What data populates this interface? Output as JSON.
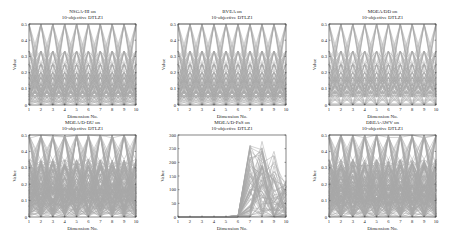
{
  "chart_data": [
    {
      "type": "line",
      "subtype": "parallel-coordinates",
      "title": "NSGA-III on 10-objective DTLZ1",
      "title_lines": [
        "NSGA-III on",
        "10-objective DTLZ1"
      ],
      "xlabel": "Dimension No.",
      "ylabel": "Value",
      "x": [
        1,
        2,
        3,
        4,
        5,
        6,
        7,
        8,
        9,
        10
      ],
      "xticks": [
        "1",
        "2",
        "3",
        "4",
        "5",
        "6",
        "7",
        "8",
        "9",
        "10"
      ],
      "yticks": [
        "0",
        "0.1",
        "0.2",
        "0.3",
        "0.4",
        "0.5"
      ],
      "ylim": [
        0,
        0.5
      ],
      "pattern": "regular",
      "levels": [
        0.5,
        0.333,
        0.25,
        0.2,
        0.167,
        0.125,
        0.1,
        0.0833,
        0.0625,
        0.05,
        0.03,
        0.0
      ],
      "flat_levels": [
        0.167,
        0.18,
        0.03,
        0.02
      ]
    },
    {
      "type": "line",
      "subtype": "parallel-coordinates",
      "title": "BVEA on 10-objective DTLZ1",
      "title_lines": [
        "BVEA on",
        "10-objective DTLZ1"
      ],
      "xlabel": "Dimension No.",
      "ylabel": "Value",
      "x": [
        1,
        2,
        3,
        4,
        5,
        6,
        7,
        8,
        9,
        10
      ],
      "xticks": [
        "1",
        "2",
        "3",
        "4",
        "5",
        "6",
        "7",
        "8",
        "9",
        "10"
      ],
      "yticks": [
        "0",
        "0.1",
        "0.2",
        "0.3",
        "0.4",
        "0.5"
      ],
      "ylim": [
        0,
        0.5
      ],
      "pattern": "regular",
      "levels": [
        0.5,
        0.333,
        0.25,
        0.2,
        0.167,
        0.125,
        0.1,
        0.0833,
        0.0625,
        0.05,
        0.03,
        0.0
      ],
      "flat_levels": [
        0.14,
        0.05,
        0.03
      ]
    },
    {
      "type": "line",
      "subtype": "parallel-coordinates",
      "title": "MOEA/DD on 10-objective DTLZ1",
      "title_lines": [
        "MOEA/DD on",
        "10-objective DTLZ1"
      ],
      "xlabel": "Dimension No.",
      "ylabel": "Value",
      "x": [
        1,
        2,
        3,
        4,
        5,
        6,
        7,
        8,
        9,
        10
      ],
      "xticks": [
        "1",
        "2",
        "3",
        "4",
        "5",
        "6",
        "7",
        "8",
        "9",
        "10"
      ],
      "yticks": [
        "0",
        "0.1",
        "0.2",
        "0.3",
        "0.4",
        "0.5"
      ],
      "ylim": [
        0,
        0.5
      ],
      "pattern": "regular",
      "levels": [
        0.5,
        0.333,
        0.25,
        0.2,
        0.167,
        0.125,
        0.1,
        0.0833,
        0.0625,
        0.05,
        0.0
      ],
      "flat_levels": [
        0.167,
        0.15,
        0.03,
        0.01
      ]
    },
    {
      "type": "line",
      "subtype": "parallel-coordinates",
      "title": "MOEA/D-DU on 10-objective DTLZ1",
      "title_lines": [
        "MOEA/D-DU on",
        "10-objective DTLZ1"
      ],
      "xlabel": "Dimension No.",
      "ylabel": "Value",
      "x": [
        1,
        2,
        3,
        4,
        5,
        6,
        7,
        8,
        9,
        10
      ],
      "xticks": [
        "1",
        "2",
        "3",
        "4",
        "5",
        "6",
        "7",
        "8",
        "9",
        "10"
      ],
      "yticks": [
        "0",
        "0.1",
        "0.2",
        "0.3",
        "0.4",
        "0.5"
      ],
      "ylim": [
        0,
        0.5
      ],
      "pattern": "regular-noisy",
      "levels": [
        0.5,
        0.333,
        0.3,
        0.25,
        0.2,
        0.167,
        0.15,
        0.125,
        0.1,
        0.0833,
        0.05,
        0.03,
        0.0
      ],
      "flat_levels": [
        0.167,
        0.03,
        0.02
      ]
    },
    {
      "type": "line",
      "subtype": "parallel-coordinates",
      "title": "MOEA/D-PaS on 10-objective DTLZ1",
      "title_lines": [
        "MOEA/D-PaS on",
        "10-objective DTLZ1"
      ],
      "xlabel": "Dimension No.",
      "ylabel": "Value",
      "x": [
        1,
        2,
        3,
        4,
        5,
        6,
        7,
        8,
        9,
        10
      ],
      "xticks": [
        "1",
        "2",
        "3",
        "4",
        "5",
        "6",
        "7",
        "8",
        "9",
        "10"
      ],
      "yticks": [
        "0",
        "50",
        "100",
        "150",
        "200",
        "250",
        "300"
      ],
      "ylim": [
        0,
        300
      ],
      "pattern": "degenerate",
      "peak_values": {
        "6": 5,
        "7": 265,
        "8": 280,
        "9": 240,
        "10": 135
      },
      "note": "Dimensions 1-5 near 0; dimensions 7-10 spread widely up to ~280"
    },
    {
      "type": "line",
      "subtype": "parallel-coordinates",
      "title": "DBEA-AWV on 10-objective DTLZ1",
      "title_lines": [
        "DBEA-AWV on",
        "10-objective DTLZ1"
      ],
      "xlabel": "Dimension No.",
      "ylabel": "Value",
      "x": [
        1,
        2,
        3,
        4,
        5,
        6,
        7,
        8,
        9,
        10
      ],
      "xticks": [
        "1",
        "2",
        "3",
        "4",
        "5",
        "6",
        "7",
        "8",
        "9",
        "10"
      ],
      "yticks": [
        "0",
        "0.1",
        "0.2",
        "0.3",
        "0.4",
        "0.5"
      ],
      "ylim": [
        0,
        0.5
      ],
      "pattern": "regular-noisy",
      "levels": [
        0.5,
        0.333,
        0.3,
        0.25,
        0.2,
        0.18,
        0.15,
        0.125,
        0.1,
        0.0833,
        0.05,
        0.02,
        0.0
      ],
      "flat_levels": [
        0.19,
        0.02
      ]
    }
  ],
  "colors": {
    "line": "#8a8a8a",
    "axis": "#333333",
    "text": "#222222"
  }
}
